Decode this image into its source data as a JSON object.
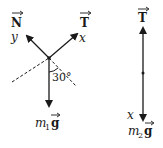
{
  "diagram": {
    "body1": {
      "name": "mass-1-on-incline",
      "forces": [
        {
          "id": "normal",
          "symbol": "N",
          "vector": true,
          "axis_label": "y"
        },
        {
          "id": "tension",
          "symbol": "T",
          "vector": true,
          "axis_label": "x"
        },
        {
          "id": "weight",
          "symbol": "m",
          "subscript": "1",
          "suffix": "g",
          "vector": true
        }
      ],
      "angle_label": "30°",
      "angle_value_deg": 30
    },
    "body2": {
      "name": "hanging-mass-2",
      "forces": [
        {
          "id": "tension",
          "symbol": "T",
          "vector": true
        },
        {
          "id": "weight",
          "symbol": "m",
          "subscript": "2",
          "suffix": "g",
          "vector": true,
          "axis_label": "x"
        }
      ]
    },
    "labels": {
      "N": "N",
      "T": "T",
      "y": "y",
      "x": "x",
      "angle": "30°",
      "m": "m",
      "sub1": "1",
      "sub2": "2",
      "g": "g"
    },
    "colors": {
      "ink": "#1a1a1a",
      "background": "#ffffff"
    }
  }
}
